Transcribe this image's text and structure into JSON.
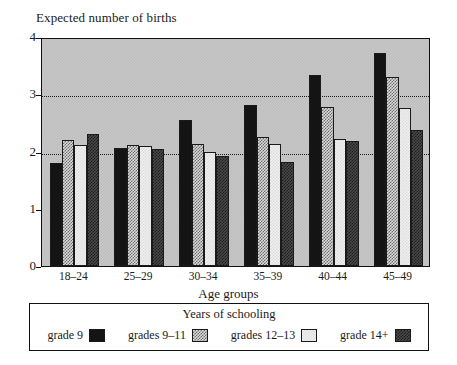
{
  "chart_data": {
    "type": "bar",
    "title": "",
    "ylabel": "Expected number of births",
    "xlabel": "Age groups",
    "categories": [
      "18–24",
      "25–29",
      "30–34",
      "35–39",
      "40–44",
      "45–49"
    ],
    "series": [
      {
        "name": "grade 9",
        "values": [
          1.8,
          2.07,
          2.55,
          2.82,
          3.33,
          3.72
        ]
      },
      {
        "name": "grades 9–11",
        "values": [
          2.2,
          2.12,
          2.13,
          2.26,
          2.78,
          3.31
        ]
      },
      {
        "name": "grades 12–13",
        "values": [
          2.11,
          2.1,
          1.99,
          2.14,
          2.22,
          2.76
        ]
      },
      {
        "name": "grade 14+",
        "values": [
          2.31,
          2.05,
          1.93,
          1.82,
          2.19,
          2.38
        ]
      }
    ],
    "ylim": [
      0,
      4
    ],
    "yticks": [
      "0",
      "1",
      "2",
      "3",
      "4"
    ],
    "ytick_values": [
      0,
      1,
      2,
      3,
      4
    ],
    "gridlines": [
      2,
      3
    ],
    "grid": true,
    "legend_position": "bottom",
    "legend_title": "Years of schooling",
    "series_colors": [
      "#141414",
      "#d8d8d8",
      "#efefef",
      "#4a4a4a"
    ],
    "series_patterns": [
      "solid",
      "light-checker",
      "pale-checker",
      "dark-checker"
    ]
  },
  "legend": {
    "title": "Years of schooling",
    "items": [
      {
        "label": "grade 9",
        "swatch": "swatch-grade-9"
      },
      {
        "label": "grades 9–11",
        "swatch": "swatch-grades-9-11"
      },
      {
        "label": "grades 12–13",
        "swatch": "swatch-grades-12-13"
      },
      {
        "label": "grade 14+",
        "swatch": "swatch-grade-14-plus"
      }
    ]
  }
}
